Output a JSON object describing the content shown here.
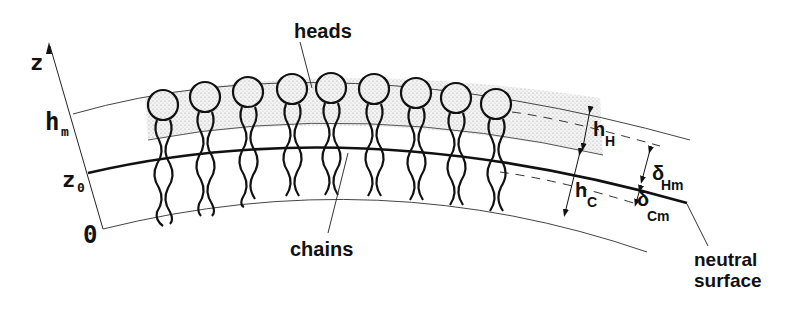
{
  "diagram": {
    "axis": {
      "label": "z",
      "ticks": [
        {
          "label": "h",
          "sub": "m"
        },
        {
          "label": "z",
          "sub": "0"
        },
        {
          "label": "0",
          "sub": ""
        }
      ]
    },
    "labels": {
      "heads": "heads",
      "chains": "chains",
      "neutral_1": "neutral",
      "neutral_2": "surface",
      "hH": "h",
      "hH_sub": "H",
      "hC": "h",
      "hC_sub": "C",
      "dHm": "δ",
      "dHm_sub": "Hm",
      "dCm": "δ",
      "dCm_sub": "Cm"
    },
    "molecule_count": 9,
    "colors": {
      "ink": "#111111",
      "stipple": "#bdbdbd",
      "background": "#ffffff"
    }
  }
}
